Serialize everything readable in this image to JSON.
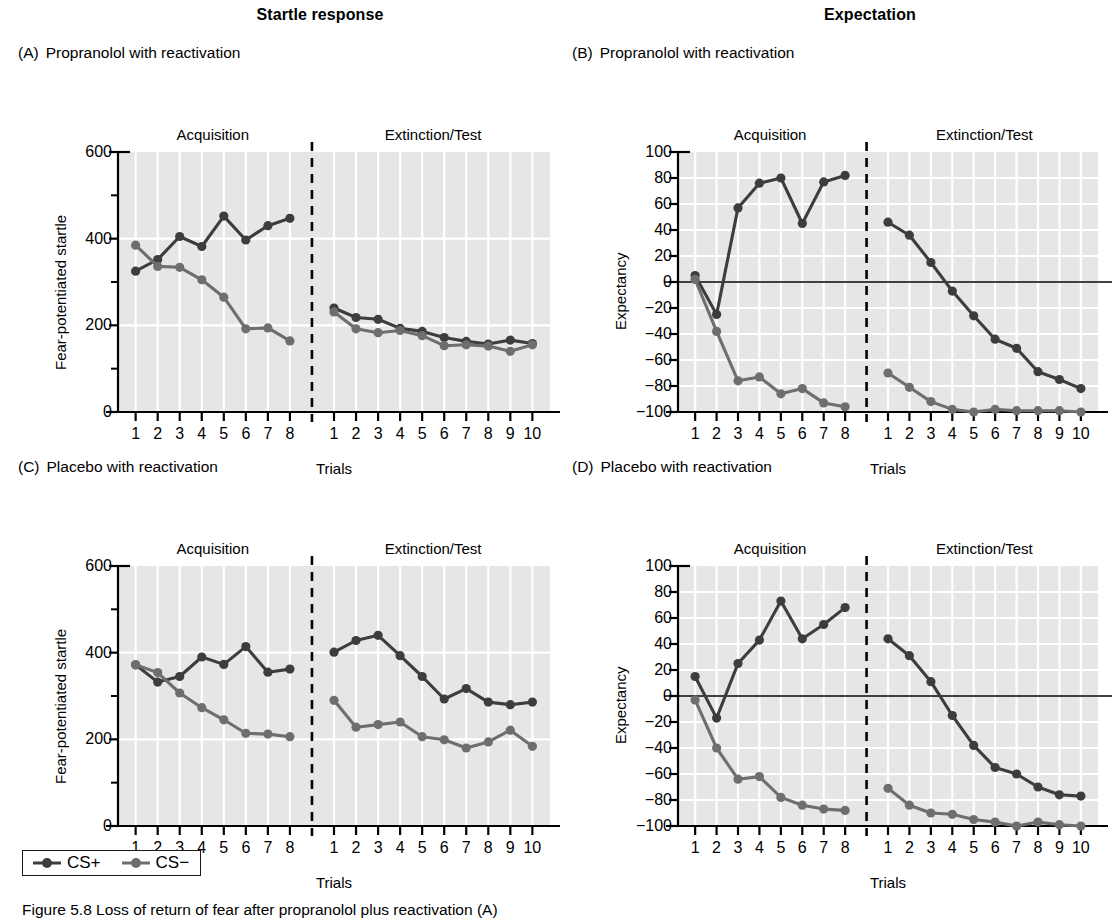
{
  "figure": {
    "column_titles": {
      "left": "Startle response",
      "right": "Expectation"
    },
    "caption": "Figure 5.8 Loss of return of fear after propranolol plus reactivation (A)",
    "legend": {
      "items": [
        {
          "label": "CS+",
          "color": "#3d3d3d"
        },
        {
          "label": "CS−",
          "color": "#6e6e6e"
        }
      ]
    },
    "colors": {
      "cs_plus": "#3d3d3d",
      "cs_minus": "#6e6e6e",
      "plot_background": "#e6e6e6",
      "gridline": "#ffffff",
      "axis": "#000000"
    },
    "phase_labels": {
      "acquisition": "Acquisition",
      "extinction": "Extinction/Test"
    },
    "axis_titles": {
      "x": "Trials",
      "y_startle": "Fear-potentiated startle",
      "y_expectancy": "Expectancy"
    },
    "x_ticks_acquisition": [
      "1",
      "2",
      "3",
      "4",
      "5",
      "6",
      "7",
      "8"
    ],
    "x_ticks_extinction": [
      "1",
      "2",
      "3",
      "4",
      "5",
      "6",
      "7",
      "8",
      "9",
      "10"
    ]
  },
  "panels": [
    {
      "id": "A",
      "letter": "(A)",
      "title": "Propranolol with reactivation"
    },
    {
      "id": "B",
      "letter": "(B)",
      "title": "Propranolol with reactivation"
    },
    {
      "id": "C",
      "letter": "(C)",
      "title": "Placebo with reactivation"
    },
    {
      "id": "D",
      "letter": "(D)",
      "title": "Placebo with reactivation"
    }
  ],
  "chart_data": [
    {
      "panel": "A",
      "type": "line",
      "title": "(A) Propranolol with reactivation",
      "supertitle": "Startle response",
      "xlabel": "Trials",
      "ylabel": "Fear-potentiated startle",
      "ylim": [
        0,
        600
      ],
      "yticks": [
        0,
        200,
        400,
        600
      ],
      "yticks_minor": [
        100,
        300,
        500
      ],
      "grid": true,
      "legend_position": "below-figure",
      "phases": [
        "Acquisition",
        "Extinction/Test"
      ],
      "x_acquisition": [
        1,
        2,
        3,
        4,
        5,
        6,
        7,
        8
      ],
      "x_extinction": [
        1,
        2,
        3,
        4,
        5,
        6,
        7,
        8,
        9,
        10
      ],
      "series": [
        {
          "name": "CS+",
          "acquisition": [
            325,
            352,
            405,
            382,
            452,
            397,
            430,
            447
          ],
          "extinction": [
            240,
            218,
            214,
            193,
            186,
            172,
            163,
            157,
            166,
            158
          ]
        },
        {
          "name": "CS−",
          "acquisition": [
            385,
            336,
            334,
            305,
            265,
            192,
            194,
            164
          ],
          "extinction": [
            231,
            192,
            183,
            188,
            176,
            153,
            155,
            152,
            140,
            155
          ]
        }
      ]
    },
    {
      "panel": "B",
      "type": "line",
      "title": "(B) Propranolol with reactivation",
      "supertitle": "Expectation",
      "xlabel": "Trials",
      "ylabel": "Expectancy",
      "ylim": [
        -100,
        100
      ],
      "yticks": [
        -100,
        -80,
        -60,
        -40,
        -20,
        0,
        20,
        40,
        60,
        80,
        100
      ],
      "grid": true,
      "zero_line": true,
      "phases": [
        "Acquisition",
        "Extinction/Test"
      ],
      "x_acquisition": [
        1,
        2,
        3,
        4,
        5,
        6,
        7,
        8
      ],
      "x_extinction": [
        1,
        2,
        3,
        4,
        5,
        6,
        7,
        8,
        9,
        10
      ],
      "series": [
        {
          "name": "CS+",
          "acquisition": [
            5,
            -25,
            57,
            76,
            80,
            45,
            77,
            82
          ],
          "extinction": [
            46,
            36,
            15,
            -7,
            -26,
            -44,
            -51,
            -69,
            -75,
            -82
          ]
        },
        {
          "name": "CS−",
          "acquisition": [
            2,
            -38,
            -76,
            -73,
            -86,
            -82,
            -93,
            -96
          ],
          "extinction": [
            -70,
            -81,
            -92,
            -98,
            -100,
            -98,
            -99,
            -99,
            -99,
            -100
          ]
        }
      ]
    },
    {
      "panel": "C",
      "type": "line",
      "title": "(C) Placebo with reactivation",
      "supertitle": "Startle response",
      "xlabel": "Trials",
      "ylabel": "Fear-potentiated startle",
      "ylim": [
        0,
        600
      ],
      "yticks": [
        0,
        200,
        400,
        600
      ],
      "yticks_minor": [
        100,
        300,
        500
      ],
      "grid": true,
      "phases": [
        "Acquisition",
        "Extinction/Test"
      ],
      "x_acquisition": [
        1,
        2,
        3,
        4,
        5,
        6,
        7,
        8
      ],
      "x_extinction": [
        1,
        2,
        3,
        4,
        5,
        6,
        7,
        8,
        9,
        10
      ],
      "series": [
        {
          "name": "CS+",
          "acquisition": [
            372,
            332,
            345,
            390,
            373,
            414,
            355,
            362
          ],
          "extinction": [
            401,
            428,
            440,
            393,
            345,
            293,
            317,
            286,
            280,
            286
          ]
        },
        {
          "name": "CS−",
          "acquisition": [
            372,
            354,
            307,
            273,
            245,
            214,
            212,
            206
          ],
          "extinction": [
            290,
            228,
            234,
            240,
            206,
            199,
            180,
            194,
            221,
            184
          ]
        }
      ]
    },
    {
      "panel": "D",
      "type": "line",
      "title": "(D) Placebo with reactivation",
      "supertitle": "Expectation",
      "xlabel": "Trials",
      "ylabel": "Expectancy",
      "ylim": [
        -100,
        100
      ],
      "yticks": [
        -100,
        -80,
        -60,
        -40,
        -20,
        0,
        20,
        40,
        60,
        80,
        100
      ],
      "grid": true,
      "zero_line": true,
      "phases": [
        "Acquisition",
        "Extinction/Test"
      ],
      "x_acquisition": [
        1,
        2,
        3,
        4,
        5,
        6,
        7,
        8
      ],
      "x_extinction": [
        1,
        2,
        3,
        4,
        5,
        6,
        7,
        8,
        9,
        10
      ],
      "series": [
        {
          "name": "CS+",
          "acquisition": [
            15,
            -17,
            25,
            43,
            73,
            44,
            55,
            68
          ],
          "extinction": [
            44,
            31,
            11,
            -15,
            -38,
            -55,
            -60,
            -70,
            -76,
            -77
          ]
        },
        {
          "name": "CS−",
          "acquisition": [
            -3,
            -40,
            -64,
            -62,
            -78,
            -84,
            -87,
            -88
          ],
          "extinction": [
            -71,
            -84,
            -90,
            -91,
            -95,
            -97,
            -100,
            -97,
            -99,
            -100
          ]
        }
      ]
    }
  ]
}
